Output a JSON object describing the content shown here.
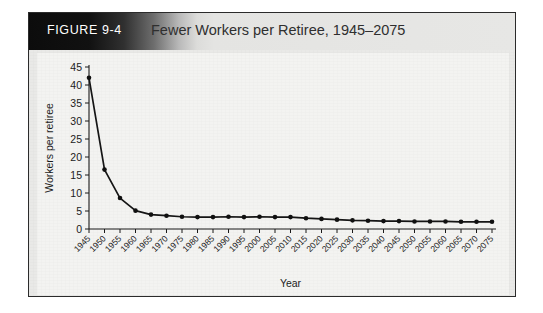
{
  "figure": {
    "number_label": "FIGURE 9-4",
    "title": "Fewer Workers per Retiree, 1945–2075"
  },
  "colors": {
    "frame_border": "#2b2b2b",
    "figure_background": "#e9e9e7",
    "plot_background": "#f3f3f1",
    "header_dark": "#0c0c0c",
    "header_light": "#e7e7e5",
    "line": "#151515",
    "text": "#1c1c1c",
    "title_text": "#2f2f2f",
    "number_text": "#ffffff"
  },
  "chart_data": {
    "type": "line",
    "title": "Fewer Workers per Retiree, 1945–2075",
    "xlabel": "Year",
    "ylabel": "Workers per retiree",
    "xlim": [
      1945,
      2075
    ],
    "ylim": [
      0,
      45
    ],
    "y_ticks": [
      0,
      5,
      10,
      15,
      20,
      25,
      30,
      35,
      40,
      45
    ],
    "grid": false,
    "legend": "none",
    "marker": "filled-circle",
    "categories": [
      "1945",
      "1950",
      "1955",
      "1960",
      "1965",
      "1970",
      "1975",
      "1980",
      "1985",
      "1990",
      "1995",
      "2000",
      "2005",
      "2010",
      "2015",
      "2020",
      "2025",
      "2030",
      "2035",
      "2040",
      "2045",
      "2050",
      "2055",
      "2060",
      "2065",
      "2070",
      "2075"
    ],
    "x": [
      1945,
      1950,
      1955,
      1960,
      1965,
      1970,
      1975,
      1980,
      1985,
      1990,
      1995,
      2000,
      2005,
      2010,
      2015,
      2020,
      2025,
      2030,
      2035,
      2040,
      2045,
      2050,
      2055,
      2060,
      2065,
      2070,
      2075
    ],
    "values": [
      42.0,
      16.5,
      8.6,
      5.1,
      4.0,
      3.7,
      3.4,
      3.3,
      3.3,
      3.4,
      3.3,
      3.4,
      3.3,
      3.3,
      3.0,
      2.8,
      2.6,
      2.4,
      2.3,
      2.2,
      2.2,
      2.1,
      2.1,
      2.1,
      2.0,
      2.0,
      2.0
    ],
    "series": [
      {
        "name": "Workers per retiree",
        "values": [
          42.0,
          16.5,
          8.6,
          5.1,
          4.0,
          3.7,
          3.4,
          3.3,
          3.3,
          3.4,
          3.3,
          3.4,
          3.3,
          3.3,
          3.0,
          2.8,
          2.6,
          2.4,
          2.3,
          2.2,
          2.2,
          2.1,
          2.1,
          2.1,
          2.0,
          2.0,
          2.0
        ]
      }
    ]
  }
}
